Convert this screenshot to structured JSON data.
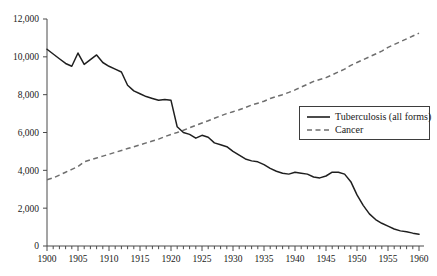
{
  "chart_data": {
    "type": "line",
    "title": "",
    "subtitle": "",
    "xlabel": "",
    "ylabel": "",
    "xlim": [
      1900,
      1960
    ],
    "ylim": [
      0,
      12000
    ],
    "grid": false,
    "legend_position": "center-right",
    "y_ticks": [
      0,
      2000,
      4000,
      6000,
      8000,
      10000,
      12000
    ],
    "y_tick_labels": [
      "0",
      "2,000",
      "4,000",
      "6,000",
      "8,000",
      "10,000",
      "12,000"
    ],
    "x_ticks": [
      1900,
      1905,
      1910,
      1915,
      1920,
      1925,
      1930,
      1935,
      1940,
      1945,
      1950,
      1955,
      1960
    ],
    "x_tick_labels": [
      "1900",
      "1905",
      "1910",
      "1915",
      "1920",
      "1925",
      "1930",
      "1935",
      "1940",
      "1945",
      "1950",
      "1955",
      "1960"
    ],
    "x_minor_tick_step": 1,
    "x": [
      1900,
      1901,
      1902,
      1903,
      1904,
      1905,
      1906,
      1907,
      1908,
      1909,
      1910,
      1911,
      1912,
      1913,
      1914,
      1915,
      1916,
      1917,
      1918,
      1919,
      1920,
      1921,
      1922,
      1923,
      1924,
      1925,
      1926,
      1927,
      1928,
      1929,
      1930,
      1931,
      1932,
      1933,
      1934,
      1935,
      1936,
      1937,
      1938,
      1939,
      1940,
      1941,
      1942,
      1943,
      1944,
      1945,
      1946,
      1947,
      1948,
      1949,
      1950,
      1951,
      1952,
      1953,
      1954,
      1955,
      1956,
      1957,
      1958,
      1959,
      1960
    ],
    "series": [
      {
        "name": "Tuberculosis (all forms)",
        "style": "solid",
        "color": "#1f1f1f",
        "values": [
          10400,
          10150,
          9900,
          9650,
          9500,
          10200,
          9600,
          9850,
          10100,
          9700,
          9500,
          9350,
          9200,
          8500,
          8200,
          8050,
          7900,
          7800,
          7700,
          7750,
          7700,
          6300,
          6000,
          5900,
          5700,
          5850,
          5750,
          5450,
          5350,
          5250,
          5000,
          4800,
          4600,
          4500,
          4450,
          4300,
          4100,
          3950,
          3850,
          3800,
          3900,
          3850,
          3800,
          3650,
          3600,
          3700,
          3900,
          3900,
          3800,
          3400,
          2700,
          2150,
          1700,
          1400,
          1200,
          1050,
          900,
          800,
          750,
          680,
          620
        ]
      },
      {
        "name": "Cancer",
        "style": "dashed",
        "color": "#6e6e6e",
        "values": [
          3500,
          3600,
          3750,
          3900,
          4050,
          4200,
          4450,
          4550,
          4650,
          4750,
          4850,
          4950,
          5050,
          5150,
          5250,
          5350,
          5450,
          5550,
          5650,
          5780,
          5900,
          6000,
          6120,
          6250,
          6380,
          6500,
          6620,
          6750,
          6880,
          7000,
          7100,
          7200,
          7320,
          7450,
          7550,
          7650,
          7800,
          7900,
          8000,
          8120,
          8250,
          8400,
          8550,
          8700,
          8800,
          8900,
          9050,
          9200,
          9350,
          9550,
          9700,
          9850,
          10000,
          10150,
          10300,
          10500,
          10650,
          10800,
          10950,
          11100,
          11250
        ]
      }
    ]
  },
  "legend": {
    "entries": [
      {
        "label": "Tuberculosis (all forms)",
        "style": "solid"
      },
      {
        "label": "Cancer",
        "style": "dashed"
      }
    ]
  }
}
